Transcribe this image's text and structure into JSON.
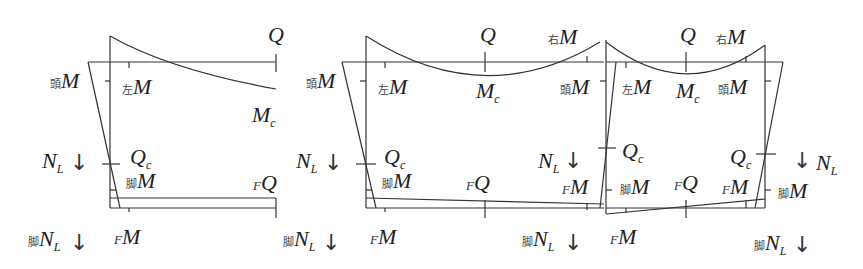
{
  "diagram": {
    "stroke_color": "#333333",
    "background": "#ffffff",
    "panels": [
      {
        "name": "panel-1-edge-span",
        "labels": {
          "Q_top": {
            "prefix": "",
            "main": "Q",
            "sub": ""
          },
          "head_M": {
            "prefix": "頭",
            "main": "M",
            "sub": ""
          },
          "left_M": {
            "prefix": "左",
            "main": "M",
            "sub": ""
          },
          "Mc": {
            "prefix": "",
            "main": "M",
            "sub": "c"
          },
          "NL": {
            "prefix": "",
            "main": "N",
            "sub": "L"
          },
          "Qc": {
            "prefix": "",
            "main": "Q",
            "sub": "c"
          },
          "foot_M": {
            "prefix": "脚",
            "main": "M",
            "sub": ""
          },
          "FQ": {
            "prefix": "F",
            "main": "Q",
            "sub": ""
          },
          "foot_NL": {
            "prefix": "脚",
            "main": "N",
            "sub": "L"
          },
          "FM": {
            "prefix": "F",
            "main": "M",
            "sub": ""
          },
          "foot_NL_right": {
            "prefix": "脚",
            "main": "N",
            "sub": "L"
          }
        }
      },
      {
        "name": "panel-2-interior-span",
        "labels": {
          "NL_left": {
            "prefix": "",
            "main": "N",
            "sub": "L"
          },
          "head_M": {
            "prefix": "頭",
            "main": "M",
            "sub": ""
          },
          "left_M": {
            "prefix": "左",
            "main": "M",
            "sub": ""
          },
          "Q_top": {
            "prefix": "",
            "main": "Q",
            "sub": ""
          },
          "Mc": {
            "prefix": "",
            "main": "M",
            "sub": "c"
          },
          "right_M": {
            "prefix": "右",
            "main": "M",
            "sub": ""
          },
          "head_M_right": {
            "prefix": "頭",
            "main": "M",
            "sub": ""
          },
          "Qc": {
            "prefix": "",
            "main": "Q",
            "sub": "c"
          },
          "foot_M": {
            "prefix": "脚",
            "main": "M",
            "sub": ""
          },
          "FQ": {
            "prefix": "F",
            "main": "Q",
            "sub": ""
          },
          "NL_right": {
            "prefix": "",
            "main": "N",
            "sub": "L"
          },
          "FM_right": {
            "prefix": "F",
            "main": "M",
            "sub": ""
          },
          "FM": {
            "prefix": "F",
            "main": "M",
            "sub": ""
          },
          "foot_NL": {
            "prefix": "脚",
            "main": "N",
            "sub": "L"
          }
        }
      },
      {
        "name": "panel-3-end-span",
        "labels": {
          "Q_top": {
            "prefix": "",
            "main": "Q",
            "sub": ""
          },
          "right_M": {
            "prefix": "右",
            "main": "M",
            "sub": ""
          },
          "left_M": {
            "prefix": "左",
            "main": "M",
            "sub": ""
          },
          "Mc": {
            "prefix": "",
            "main": "M",
            "sub": "c"
          },
          "head_M": {
            "prefix": "頭",
            "main": "M",
            "sub": ""
          },
          "Qc_left": {
            "prefix": "",
            "main": "Q",
            "sub": "c"
          },
          "Qc_right": {
            "prefix": "",
            "main": "Q",
            "sub": "c"
          },
          "NL": {
            "prefix": "",
            "main": "N",
            "sub": "L"
          },
          "foot_M_left": {
            "prefix": "脚",
            "main": "M",
            "sub": ""
          },
          "FQ": {
            "prefix": "F",
            "main": "Q",
            "sub": ""
          },
          "FM_right": {
            "prefix": "F",
            "main": "M",
            "sub": ""
          },
          "foot_M_right": {
            "prefix": "脚",
            "main": "M",
            "sub": ""
          },
          "FM": {
            "prefix": "F",
            "main": "M",
            "sub": ""
          },
          "foot_NL": {
            "prefix": "脚",
            "main": "N",
            "sub": "L"
          }
        }
      }
    ],
    "arrow_glyph": "↓"
  }
}
